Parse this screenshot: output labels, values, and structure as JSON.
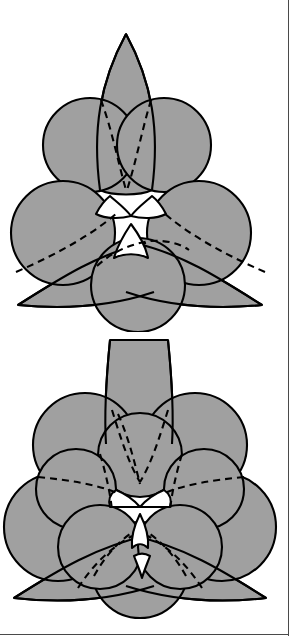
{
  "page": {
    "width": 292,
    "height": 643,
    "background_color": "#ffffff"
  },
  "style": {
    "fill_gray": "#a0a0a0",
    "stroke_black": "#000000",
    "stroke_width": 2.1,
    "dashed_stroke_width": 2.1,
    "dash_pattern": "7,5",
    "frame_color": "#4a4a4a",
    "white": "#ffffff"
  },
  "figures": [
    {
      "id": "figure-top",
      "name": "upper-packing-diagram",
      "label": "Upper figure: seven-element trefoil packing",
      "symmetry": "3-fold rotational",
      "elements": {
        "petals": 3,
        "circles": 6,
        "dashed_arcs": 5,
        "white_gaps": 3
      },
      "circle_radius": 47,
      "petal_length": 120
    },
    {
      "id": "figure-bottom",
      "name": "lower-packing-diagram",
      "label": "Lower figure: thirteen-element trefoil packing",
      "symmetry": "3-fold rotational",
      "elements": {
        "petals": 3,
        "large_circles": 6,
        "small_circles": 6,
        "dashed_arcs": 9,
        "white_gaps": 4
      },
      "large_circle_radius": 45,
      "small_circle_radius": 36,
      "petal_length": 110
    }
  ],
  "frame": {
    "vertical_rule": "right-edge-border",
    "horizontal_rule": "bottom-edge-border"
  }
}
